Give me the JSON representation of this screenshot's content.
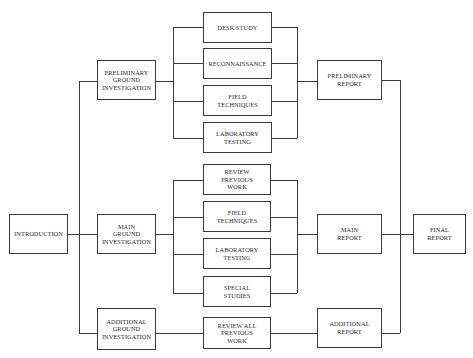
{
  "diagram": {
    "type": "flowchart",
    "nodes": {
      "introduction": "INTRODUCTION",
      "preliminary_gi": "PRELIMINARY\nGROUND\nINVESTIGATION",
      "main_gi": "MAIN\nGROUND\nINVESTIGATION",
      "additional_gi": "ADDITIONAL\nGROUND\nINVESTIGATION",
      "desk_study": "DESK STUDY",
      "reconnaissance": "RECONNAISSANCE",
      "field_techniques_1": "FIELD\nTECHNIQUES",
      "laboratory_testing_1": "LABORATORY\nTESTING",
      "review_previous_work": "REVIEW\nPREVIOUS\nWORK",
      "field_techniques_2": "FIELD\nTECHNIQUES",
      "laboratory_testing_2": "LABORATORY\nTESTING",
      "special_studies": "SPECIAL\nSTUDIES",
      "review_all_previous_work": "REVIEW ALL\nPREVIOUS\nWORK",
      "preliminary_report": "PRELIMINARY\nREPORT",
      "main_report": "MAIN\nREPORT",
      "additional_report": "ADDITIONAL\nREPORT",
      "final_report": "FINAL\nREPORT"
    },
    "edges": [
      [
        "introduction",
        "preliminary_gi"
      ],
      [
        "introduction",
        "main_gi"
      ],
      [
        "introduction",
        "additional_gi"
      ],
      [
        "preliminary_gi",
        "desk_study"
      ],
      [
        "preliminary_gi",
        "reconnaissance"
      ],
      [
        "preliminary_gi",
        "field_techniques_1"
      ],
      [
        "preliminary_gi",
        "laboratory_testing_1"
      ],
      [
        "desk_study",
        "preliminary_report"
      ],
      [
        "reconnaissance",
        "preliminary_report"
      ],
      [
        "field_techniques_1",
        "preliminary_report"
      ],
      [
        "laboratory_testing_1",
        "preliminary_report"
      ],
      [
        "main_gi",
        "review_previous_work"
      ],
      [
        "main_gi",
        "field_techniques_2"
      ],
      [
        "main_gi",
        "laboratory_testing_2"
      ],
      [
        "main_gi",
        "special_studies"
      ],
      [
        "review_previous_work",
        "main_report"
      ],
      [
        "field_techniques_2",
        "main_report"
      ],
      [
        "laboratory_testing_2",
        "main_report"
      ],
      [
        "special_studies",
        "main_report"
      ],
      [
        "additional_gi",
        "review_all_previous_work"
      ],
      [
        "review_all_previous_work",
        "additional_report"
      ],
      [
        "preliminary_report",
        "final_report"
      ],
      [
        "main_report",
        "final_report"
      ],
      [
        "additional_report",
        "final_report"
      ]
    ],
    "colors": {
      "line": "#3a3a3a",
      "text": "#2a2a2a",
      "background": "#ffffff"
    }
  }
}
